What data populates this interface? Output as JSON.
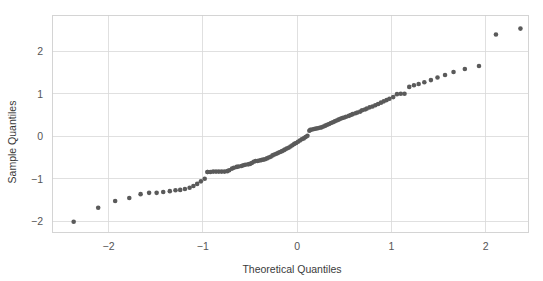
{
  "figure": {
    "background_color": "#ffffff",
    "width": 543,
    "height": 281
  },
  "chart_data": {
    "type": "scatter",
    "title": "",
    "xlabel": "Theoretical Quantiles",
    "ylabel": "Sample Quantiles",
    "xlim": [
      -2.6,
      2.45
    ],
    "ylim": [
      -2.25,
      2.85
    ],
    "xticks": [
      -2,
      -1,
      0,
      1,
      2
    ],
    "xticklabels": [
      "−2",
      "−1",
      "0",
      "1",
      "2"
    ],
    "yticks": [
      -2,
      -1,
      0,
      1,
      2
    ],
    "yticklabels": [
      "−2",
      "−1",
      "0",
      "1",
      "2"
    ],
    "grid": true,
    "grid_color": "#d8d8d8",
    "legend": null,
    "marker_color": "#5a5a5a",
    "marker_size": 4.6,
    "series": [
      {
        "name": "Sample vs Theoretical Quantiles",
        "x": [
          -2.37,
          -2.11,
          -1.93,
          -1.78,
          -1.66,
          -1.57,
          -1.49,
          -1.42,
          -1.35,
          -1.29,
          -1.24,
          -1.19,
          -1.14,
          -1.1,
          -1.06,
          -1.02,
          -0.98,
          -0.95,
          -0.95,
          -0.92,
          -0.89,
          -0.86,
          -0.83,
          -0.8,
          -0.77,
          -0.74,
          -0.72,
          -0.69,
          -0.67,
          -0.64,
          -0.62,
          -0.59,
          -0.57,
          -0.55,
          -0.52,
          -0.5,
          -0.48,
          -0.46,
          -0.44,
          -0.42,
          -0.4,
          -0.38,
          -0.36,
          -0.34,
          -0.32,
          -0.3,
          -0.28,
          -0.26,
          -0.24,
          -0.22,
          -0.2,
          -0.18,
          -0.16,
          -0.14,
          -0.13,
          -0.11,
          -0.09,
          -0.07,
          -0.05,
          -0.03,
          -0.01,
          0.01,
          0.03,
          0.05,
          0.07,
          0.09,
          0.11,
          0.13,
          0.14,
          0.16,
          0.18,
          0.2,
          0.22,
          0.24,
          0.26,
          0.28,
          0.3,
          0.32,
          0.34,
          0.36,
          0.38,
          0.4,
          0.42,
          0.44,
          0.46,
          0.48,
          0.5,
          0.52,
          0.55,
          0.57,
          0.59,
          0.62,
          0.64,
          0.67,
          0.69,
          0.72,
          0.74,
          0.77,
          0.8,
          0.83,
          0.86,
          0.89,
          0.92,
          0.95,
          0.98,
          1.02,
          1.06,
          1.1,
          1.14,
          1.19,
          1.24,
          1.29,
          1.35,
          1.42,
          1.49,
          1.57,
          1.66,
          1.78,
          1.93,
          2.11,
          2.37
        ],
        "y": [
          -2.01,
          -1.68,
          -1.52,
          -1.45,
          -1.36,
          -1.33,
          -1.33,
          -1.31,
          -1.29,
          -1.27,
          -1.26,
          -1.24,
          -1.21,
          -1.17,
          -1.12,
          -1.06,
          -1.0,
          -0.84,
          -0.84,
          -0.84,
          -0.83,
          -0.83,
          -0.83,
          -0.83,
          -0.83,
          -0.82,
          -0.8,
          -0.76,
          -0.74,
          -0.72,
          -0.71,
          -0.7,
          -0.68,
          -0.67,
          -0.66,
          -0.65,
          -0.63,
          -0.6,
          -0.58,
          -0.58,
          -0.57,
          -0.56,
          -0.55,
          -0.54,
          -0.52,
          -0.5,
          -0.48,
          -0.45,
          -0.43,
          -0.41,
          -0.39,
          -0.37,
          -0.35,
          -0.33,
          -0.31,
          -0.29,
          -0.27,
          -0.24,
          -0.21,
          -0.18,
          -0.16,
          -0.13,
          -0.1,
          -0.07,
          -0.05,
          -0.02,
          0.01,
          0.13,
          0.15,
          0.16,
          0.17,
          0.18,
          0.19,
          0.2,
          0.21,
          0.23,
          0.25,
          0.27,
          0.29,
          0.31,
          0.33,
          0.35,
          0.37,
          0.39,
          0.41,
          0.43,
          0.44,
          0.46,
          0.48,
          0.5,
          0.52,
          0.54,
          0.56,
          0.58,
          0.61,
          0.63,
          0.65,
          0.68,
          0.7,
          0.73,
          0.76,
          0.79,
          0.82,
          0.85,
          0.88,
          0.92,
          0.99,
          1.0,
          1.0,
          1.16,
          1.2,
          1.23,
          1.27,
          1.32,
          1.38,
          1.44,
          1.51,
          1.58,
          1.65,
          2.39,
          2.53
        ]
      }
    ]
  }
}
